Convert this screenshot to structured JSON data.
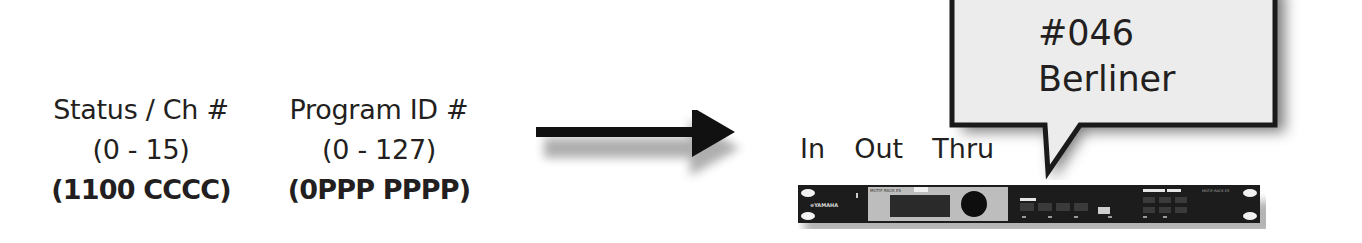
{
  "message_fields": [
    {
      "title": "Status / Ch #",
      "range": "(0 - 15)",
      "bits": "(1100 CCCC)"
    },
    {
      "title": "Program ID #",
      "range": "(0 - 127)",
      "bits": "(0PPP PPPP)"
    }
  ],
  "arrow": {
    "direction": "right",
    "icon": "arrow-right-icon"
  },
  "device": {
    "ports_label": "In  Out  Thru",
    "icon": "synth-rack-module-icon",
    "brand": "YAMAHA",
    "model": "MOTIF-RACK ES"
  },
  "callout": {
    "program_number": "#046",
    "program_name": "Berliner"
  },
  "colors": {
    "text": "#231f20",
    "callout_fill": "#ececec",
    "callout_border": "#1a1a1a",
    "rack_body": "#1c1c1c",
    "rack_panel": "#bdbdbd"
  }
}
